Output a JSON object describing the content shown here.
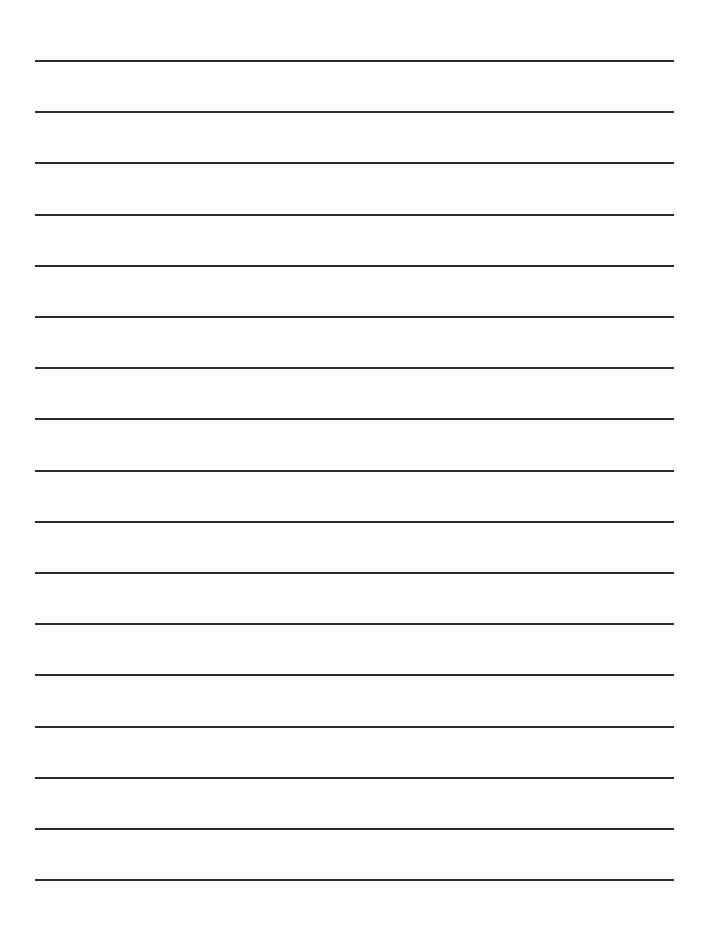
{
  "page": {
    "type": "lined-paper",
    "background_color": "#ffffff",
    "line_color": "#2b2b2b",
    "line_count": 17,
    "first_line_y": 61,
    "line_spacing": 51.2,
    "line_left": 35,
    "line_right": 674,
    "line_thickness": 2
  }
}
